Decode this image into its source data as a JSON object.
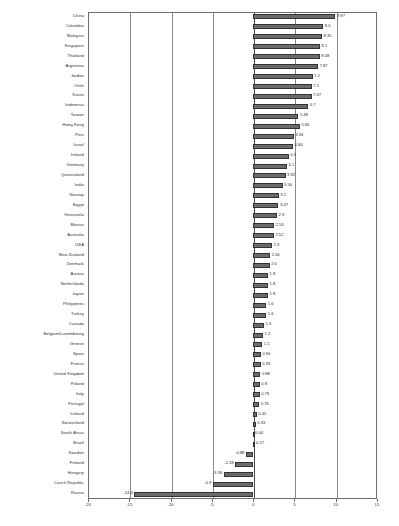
{
  "chart_data": {
    "type": "bar",
    "orientation": "horizontal",
    "title": "",
    "subtitle": "",
    "xlabel": "",
    "ylabel": "",
    "xlim": [
      -20,
      15
    ],
    "xticks": [
      -20,
      -15,
      -10,
      -5,
      0,
      5,
      10,
      15
    ],
    "xticklabels": [
      "-20",
      "-15",
      "-10",
      "-5",
      "0",
      "5",
      "10",
      "15"
    ],
    "grid": true,
    "legend": null,
    "bar_color": "#6b6b6b",
    "categories": [
      "China",
      "Columbia",
      "Malaysia",
      "Singapore",
      "Thailand",
      "Argentina",
      "Jordan",
      "Chile",
      "Korea",
      "Indonesia",
      "Taiwan",
      "Hong Kong",
      "Peru",
      "Israel",
      "Ireland",
      "Germany",
      "Queensland",
      "India",
      "Norway",
      "Egypt",
      "Venezuela",
      "Mexico",
      "Australia",
      "USA",
      "New Zealand",
      "Denmark",
      "Austria",
      "Netherlands",
      "Japan",
      "Philippines",
      "Turkey",
      "Canada",
      "Belgium/Luxembourg",
      "Greece",
      "Spain",
      "France",
      "United Kingdom",
      "Poland",
      "Italy",
      "Portugal",
      "Iceland",
      "Switzerland",
      "South Africa",
      "Brazil",
      "Sweden",
      "Finland",
      "Hungary",
      "Czech Republic",
      "Russia"
    ],
    "values": [
      9.97,
      8.5,
      8.35,
      8.1,
      8.08,
      7.87,
      7.2,
      7.1,
      7.07,
      6.7,
      5.48,
      5.66,
      4.94,
      4.84,
      4.3,
      4.1,
      3.92,
      3.56,
      3.1,
      3.07,
      2.9,
      2.53,
      2.52,
      2.3,
      2.06,
      2.0,
      1.8,
      1.8,
      1.8,
      1.6,
      1.6,
      1.3,
      1.2,
      1.1,
      0.94,
      0.93,
      0.88,
      0.8,
      0.79,
      0.76,
      0.45,
      0.33,
      0.04,
      0.17,
      -0.88,
      -2.18,
      -3.58,
      -4.9,
      -14.4
    ],
    "value_labels": [
      "9.97",
      "8.5",
      "8.35",
      "8.1",
      "8.08",
      "7.87",
      "7.2",
      "7.1",
      "7.07",
      "6.7",
      "5.48",
      "5.66",
      "4.94",
      "4.84",
      "4.3",
      "4.1",
      "3.92",
      "3.56",
      "3.1",
      "3.07",
      "2.9",
      "2.53",
      "2.52",
      "2.3",
      "2.06",
      "2.0",
      "1.8",
      "1.8",
      "1.8",
      "1.6",
      "1.6",
      "1.3",
      "1.2",
      "1.1",
      "0.94",
      "0.93",
      "0.88",
      "0.8",
      "0.79",
      "0.76",
      "0.45",
      "0.33",
      "0.04",
      "0.17",
      "-0.88",
      "-2.18",
      "-3.58",
      "-4.9",
      "-14.4"
    ]
  }
}
